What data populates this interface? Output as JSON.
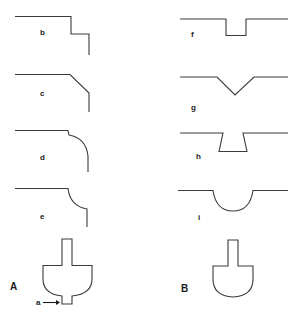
{
  "figure": {
    "panels": [
      {
        "id": "A",
        "label": "A"
      },
      {
        "id": "B",
        "label": "B"
      }
    ],
    "profiles_left": [
      {
        "label": "b",
        "shape": "step"
      },
      {
        "label": "c",
        "shape": "chamfer"
      },
      {
        "label": "d",
        "shape": "notched-convex-round"
      },
      {
        "label": "e",
        "shape": "concave-round"
      }
    ],
    "profiles_right": [
      {
        "label": "f",
        "shape": "rectangular-groove"
      },
      {
        "label": "g",
        "shape": "v-groove"
      },
      {
        "label": "h",
        "shape": "dovetail-groove"
      },
      {
        "label": "i",
        "shape": "semicircular-groove"
      }
    ],
    "shape_A": {
      "label": "A",
      "annotation": "a",
      "annotation_arrow": "right-arrow"
    },
    "shape_B": {
      "label": "B"
    }
  },
  "colors": {
    "stroke": "#3a3a3a",
    "text": "#1a1a1a",
    "background": "#ffffff"
  }
}
